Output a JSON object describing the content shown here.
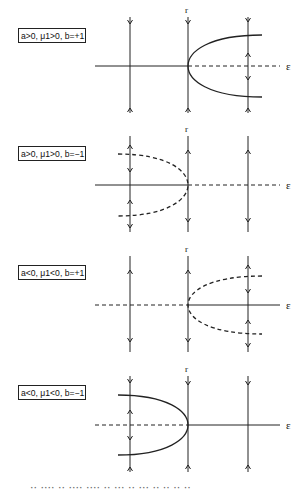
{
  "figure": {
    "panels": [
      {
        "label": "a>0, μ1>0, b=+1",
        "axis_label": "ε",
        "vertical_label": "r",
        "axis_y": 66,
        "axis_left_style": "solid",
        "axis_right_style": "dashed",
        "branch_direction": "right",
        "branch_style": "solid",
        "branch_spread": 31,
        "lines": [
          {
            "x": 130,
            "arrows": [
              {
                "y": 24,
                "dir": "down"
              },
              {
                "y": 108,
                "dir": "up"
              }
            ]
          },
          {
            "x": 188,
            "arrows": [
              {
                "y": 24,
                "dir": "down"
              },
              {
                "y": 108,
                "dir": "up"
              }
            ]
          },
          {
            "x": 248,
            "arrows": [
              {
                "y": 22,
                "dir": "down"
              },
              {
                "y": 53,
                "dir": "up"
              },
              {
                "y": 80,
                "dir": "down"
              },
              {
                "y": 108,
                "dir": "up"
              }
            ]
          }
        ]
      },
      {
        "label": "a>0, μ1>0, b=−1",
        "axis_label": "ε",
        "vertical_label": "r",
        "axis_y": 185,
        "axis_left_style": "solid",
        "axis_right_style": "dashed",
        "branch_direction": "left",
        "branch_style": "dashed",
        "branch_spread": 31,
        "lines": [
          {
            "x": 130,
            "arrows": [
              {
                "y": 145,
                "dir": "up"
              },
              {
                "y": 172,
                "dir": "down"
              },
              {
                "y": 200,
                "dir": "up"
              },
              {
                "y": 228,
                "dir": "down"
              }
            ]
          },
          {
            "x": 188,
            "arrows": [
              {
                "y": 150,
                "dir": "up"
              },
              {
                "y": 222,
                "dir": "down"
              }
            ]
          },
          {
            "x": 248,
            "arrows": [
              {
                "y": 150,
                "dir": "up"
              },
              {
                "y": 222,
                "dir": "down"
              }
            ]
          }
        ]
      },
      {
        "label": "a<0, μ1<0, b=+1",
        "axis_label": "ε",
        "vertical_label": "r",
        "axis_y": 305,
        "axis_left_style": "dashed",
        "axis_right_style": "solid",
        "branch_direction": "right",
        "branch_style": "dashed",
        "branch_spread": 29,
        "lines": [
          {
            "x": 130,
            "arrows": [
              {
                "y": 270,
                "dir": "up"
              },
              {
                "y": 342,
                "dir": "down"
              }
            ]
          },
          {
            "x": 188,
            "arrows": [
              {
                "y": 270,
                "dir": "up"
              },
              {
                "y": 342,
                "dir": "down"
              }
            ]
          },
          {
            "x": 248,
            "arrows": [
              {
                "y": 265,
                "dir": "up"
              },
              {
                "y": 293,
                "dir": "down"
              },
              {
                "y": 320,
                "dir": "up"
              },
              {
                "y": 347,
                "dir": "down"
              }
            ]
          }
        ]
      },
      {
        "label": "a<0, μ1<0, b=−1",
        "axis_label": "ε",
        "vertical_label": "r",
        "axis_y": 425,
        "axis_left_style": "dashed",
        "axis_right_style": "solid",
        "branch_direction": "left",
        "branch_style": "solid",
        "branch_spread": 30,
        "lines": [
          {
            "x": 130,
            "arrows": [
              {
                "y": 383,
                "dir": "down"
              },
              {
                "y": 410,
                "dir": "up"
              },
              {
                "y": 440,
                "dir": "down"
              },
              {
                "y": 467,
                "dir": "up"
              }
            ]
          },
          {
            "x": 188,
            "arrows": [
              {
                "y": 385,
                "dir": "down"
              },
              {
                "y": 465,
                "dir": "up"
              }
            ]
          },
          {
            "x": 248,
            "arrows": [
              {
                "y": 385,
                "dir": "down"
              },
              {
                "y": 465,
                "dir": "up"
              }
            ]
          }
        ]
      }
    ],
    "caption_clipped": "·· ···· ·· ···· ···· ·· ··· ·· ··· ·· ·· ·· ··"
  }
}
